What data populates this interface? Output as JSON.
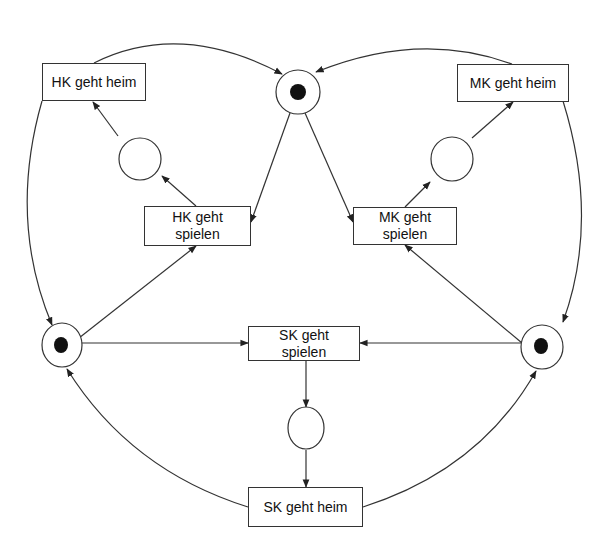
{
  "diagram": {
    "type": "petri-net",
    "colors": {
      "stroke": "#333333",
      "token": "#111111",
      "background": "#ffffff"
    },
    "places": [
      {
        "id": "p-top",
        "label": "",
        "tokens": 1,
        "cx": 298,
        "cy": 92,
        "rx": 22,
        "ry": 22
      },
      {
        "id": "p-left",
        "label": "",
        "tokens": 1,
        "cx": 62,
        "cy": 345,
        "rx": 20,
        "ry": 22
      },
      {
        "id": "p-right",
        "label": "",
        "tokens": 1,
        "cx": 542,
        "cy": 347,
        "rx": 21,
        "ry": 22
      },
      {
        "id": "p-hk",
        "label": "",
        "tokens": 0,
        "cx": 140,
        "cy": 159,
        "rx": 21,
        "ry": 21
      },
      {
        "id": "p-mk",
        "label": "",
        "tokens": 0,
        "cx": 452,
        "cy": 159,
        "rx": 21,
        "ry": 22
      },
      {
        "id": "p-sk",
        "label": "",
        "tokens": 0,
        "cx": 306,
        "cy": 428,
        "rx": 18,
        "ry": 21
      }
    ],
    "transitions": {
      "hk_heim": {
        "line1": "HK geht heim",
        "line2": ""
      },
      "hk_spielen": {
        "line1": "HK geht",
        "line2": "spielen"
      },
      "mk_heim": {
        "line1": "MK geht heim",
        "line2": ""
      },
      "mk_spielen": {
        "line1": "MK geht",
        "line2": "spielen"
      },
      "sk_spielen": {
        "line1": "SK geht",
        "line2": "spielen"
      },
      "sk_heim": {
        "line1": "SK geht heim",
        "line2": ""
      }
    },
    "arcs": [
      {
        "from": "HK geht heim",
        "to": "p-top"
      },
      {
        "from": "MK geht heim",
        "to": "p-top"
      },
      {
        "from": "p-top",
        "to": "HK geht spielen"
      },
      {
        "from": "p-top",
        "to": "MK geht spielen"
      },
      {
        "from": "HK geht spielen",
        "to": "p-hk"
      },
      {
        "from": "p-hk",
        "to": "HK geht heim"
      },
      {
        "from": "MK geht spielen",
        "to": "p-mk"
      },
      {
        "from": "p-mk",
        "to": "MK geht heim"
      },
      {
        "from": "HK geht heim",
        "to": "p-left"
      },
      {
        "from": "MK geht heim",
        "to": "p-right"
      },
      {
        "from": "p-left",
        "to": "HK geht spielen"
      },
      {
        "from": "p-right",
        "to": "MK geht spielen"
      },
      {
        "from": "p-left",
        "to": "SK geht spielen"
      },
      {
        "from": "p-right",
        "to": "SK geht spielen"
      },
      {
        "from": "SK geht spielen",
        "to": "p-sk"
      },
      {
        "from": "p-sk",
        "to": "SK geht heim"
      },
      {
        "from": "SK geht heim",
        "to": "p-left"
      },
      {
        "from": "SK geht heim",
        "to": "p-right"
      }
    ]
  }
}
